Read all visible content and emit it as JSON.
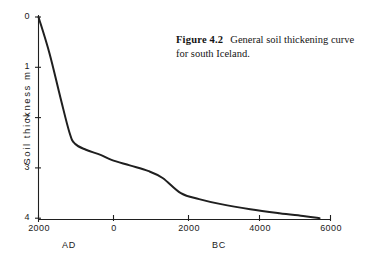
{
  "figure": {
    "caption_label": "Figure 4.2",
    "caption_text": "General soil thickening curve for south Iceland.",
    "background_color": "#ffffff",
    "ink_color": "#1a1a1a"
  },
  "chart_data": {
    "type": "line",
    "title": "General soil thickening curve for south Iceland.",
    "xlabel": "",
    "ylabel": "Soil thickness  m",
    "y_axis_title": "Soil thickness  m",
    "xlim": [
      2000,
      -6000
    ],
    "ylim": [
      0,
      4
    ],
    "y_inverted": true,
    "grid": false,
    "legend": "none",
    "x_tick_labels": [
      "2000",
      "0",
      "2000",
      "4000",
      "6000"
    ],
    "x_tick_values": [
      2000,
      0,
      -2000,
      -4000,
      -6000
    ],
    "y_tick_labels": [
      "0",
      "1",
      "2",
      "3",
      "4"
    ],
    "y_tick_values": [
      0,
      1,
      2,
      3,
      4
    ],
    "era_labels": [
      {
        "text": "AD",
        "x_value": 1200
      },
      {
        "text": "BC",
        "x_value": -2800
      }
    ],
    "x_units": "years (AD to BC)",
    "y_units": "metres",
    "series": [
      {
        "name": "Soil thickening curve",
        "x": [
          2000,
          1700,
          1400,
          1150,
          1000,
          700,
          300,
          0,
          -500,
          -1000,
          -1400,
          -1900,
          -2400,
          -3000,
          -3800,
          -4600,
          -5300,
          -5700
        ],
        "y": [
          0.0,
          0.72,
          1.6,
          2.3,
          2.52,
          2.64,
          2.74,
          2.84,
          2.95,
          3.06,
          3.2,
          3.5,
          3.62,
          3.72,
          3.82,
          3.9,
          3.96,
          4.0
        ]
      }
    ],
    "annotations": [
      {
        "text": "knee of curve",
        "x_value": 1000,
        "y_value": 2.52
      }
    ]
  },
  "axis": {
    "y_label_text": "Soil  thickness   m",
    "ticks_y": [
      {
        "label": "0",
        "value": 0
      },
      {
        "label": "1",
        "value": 1
      },
      {
        "label": "2",
        "value": 2
      },
      {
        "label": "3",
        "value": 3
      },
      {
        "label": "4",
        "value": 4
      }
    ],
    "ticks_x": [
      {
        "label": "2000",
        "value": 2000
      },
      {
        "label": "0",
        "value": 0
      },
      {
        "label": "2000",
        "value": -2000
      },
      {
        "label": "4000",
        "value": -4000
      },
      {
        "label": "6000",
        "value": -6000
      }
    ],
    "era_ad": "AD",
    "era_bc": "BC"
  }
}
